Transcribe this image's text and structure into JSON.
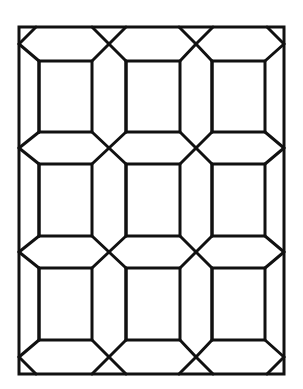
{
  "diagram": {
    "title": "",
    "colors": {
      "line": "#111111",
      "background": "#ffffff"
    },
    "stroke_width": 3,
    "frame": {
      "x1": 19,
      "y1": 27,
      "x2": 284,
      "y2": 374
    },
    "columns": [
      {
        "left": 39,
        "right": 92
      },
      {
        "left": 126,
        "right": 180
      },
      {
        "left": 212,
        "right": 265
      }
    ],
    "rows": [
      {
        "top": 61,
        "bottom": 132
      },
      {
        "top": 164,
        "bottom": 236
      },
      {
        "top": 268,
        "bottom": 340
      }
    ],
    "crossing_x": [
      19,
      109,
      196,
      284
    ],
    "crossing_y": [
      27,
      148,
      252,
      374
    ]
  }
}
